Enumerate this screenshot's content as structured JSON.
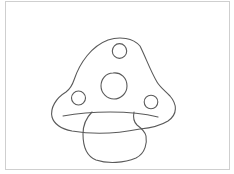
{
  "image": {
    "subject": "mushroom line drawing",
    "colors": {
      "background": "#ffffff",
      "frame_border": "#cfcfcf",
      "stroke": "#5a5a5a"
    },
    "parts": {
      "cap": "cap-outline",
      "brim": "cap-brim-line",
      "stem": "stem-outline",
      "spots": [
        "top-spot",
        "center-spot",
        "left-spot",
        "right-spot"
      ]
    }
  }
}
